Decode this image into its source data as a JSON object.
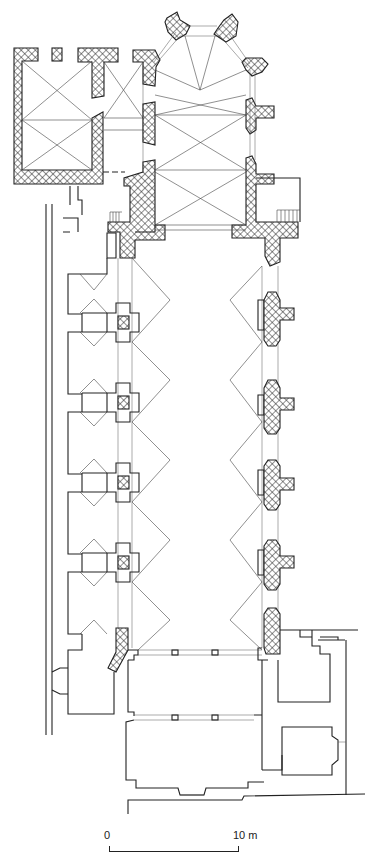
{
  "figure": {
    "type": "architectural-floor-plan"
  },
  "scale_bar": {
    "start_label": "0",
    "end_label": "10 m",
    "unit": "m",
    "length_m": 10
  },
  "colors": {
    "line": "#222222",
    "background": "#ffffff",
    "hatch": "#222222"
  }
}
